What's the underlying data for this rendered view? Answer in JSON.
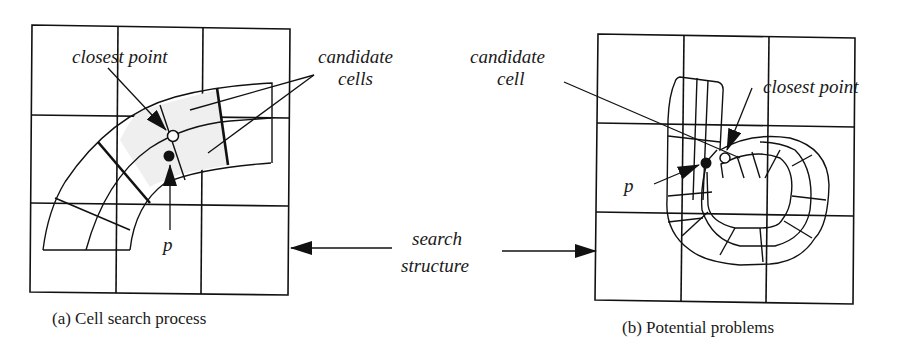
{
  "figure": {
    "panel_a": {
      "caption": "(a) Cell search process",
      "labels": {
        "closest_point": "closest point",
        "candidate_line1": "candidate",
        "candidate_line2": "cells",
        "p": "p"
      }
    },
    "panel_b": {
      "caption": "(b) Potential problems",
      "labels": {
        "candidate_line1": "candidate",
        "candidate_line2": "cell",
        "closest_point": "closest point",
        "p": "p"
      }
    },
    "shared": {
      "search_line1": "search",
      "search_line2": "structure"
    },
    "colors": {
      "ink": "#111111",
      "background": "#ffffff",
      "candidate_fill": "#efefef"
    }
  }
}
